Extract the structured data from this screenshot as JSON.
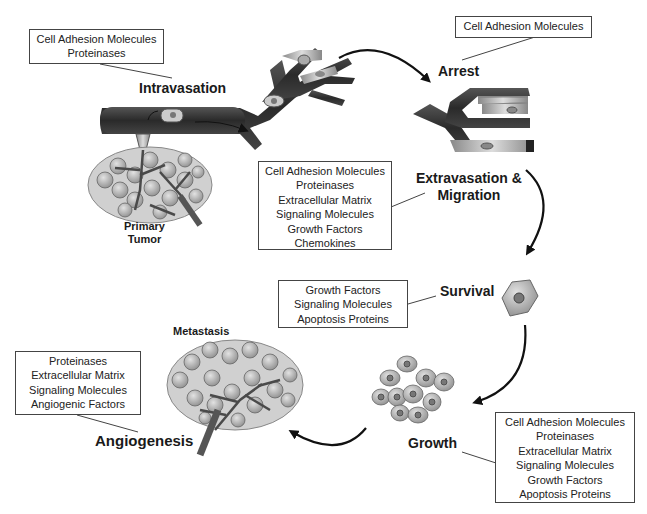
{
  "diagram": {
    "type": "cycle",
    "stages": [
      {
        "id": "intravasation",
        "label": "Intravasation",
        "factors": [
          "Cell Adhesion Molecules",
          "Proteinases"
        ]
      },
      {
        "id": "arrest",
        "label": "Arrest",
        "factors": [
          "Cell Adhesion Molecules"
        ]
      },
      {
        "id": "extravasation",
        "label_line1": "Extravasation &",
        "label_line2": "Migration",
        "factors": [
          "Cell Adhesion Molecules",
          "Proteinases",
          "Extracellular Matrix",
          "Signaling Molecules",
          "Growth Factors",
          "Chemokines"
        ]
      },
      {
        "id": "survival",
        "label": "Survival",
        "factors": [
          "Growth Factors",
          "Signaling Molecules",
          "Apoptosis Proteins"
        ]
      },
      {
        "id": "growth",
        "label": "Growth",
        "factors": [
          "Cell Adhesion Molecules",
          "Proteinases",
          "Extracellular Matrix",
          "Signaling Molecules",
          "Growth Factors",
          "Apoptosis Proteins"
        ]
      },
      {
        "id": "angiogenesis",
        "label": "Angiogenesis",
        "factors": [
          "Proteinases",
          "Extracellular Matrix",
          "Signaling Molecules",
          "Angiogenic Factors"
        ]
      }
    ],
    "illustration_labels": {
      "primary_tumor_line1": "Primary",
      "primary_tumor_line2": "Tumor",
      "metastasis": "Metastasis"
    },
    "colors": {
      "vessel": "#2e2e2e",
      "cell_fill": "#b8b8b8",
      "nucleus": "#6e6e6e",
      "arrow": "#111111",
      "box_border": "#444444"
    }
  }
}
